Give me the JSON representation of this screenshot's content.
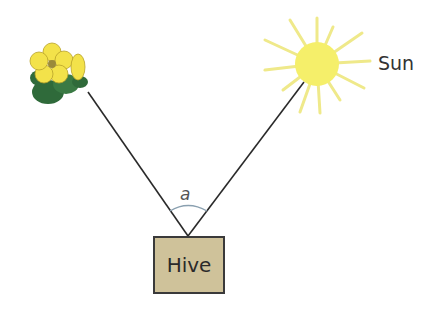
{
  "diagram": {
    "labels": {
      "sun": "Sun",
      "hive": "Hive",
      "angle": "a"
    },
    "nodes": [
      {
        "id": "flower",
        "icon": "flower-icon"
      },
      {
        "id": "sun",
        "icon": "sun-icon",
        "label": "Sun"
      },
      {
        "id": "hive",
        "label": "Hive"
      }
    ],
    "edges": [
      {
        "from": "hive",
        "to": "flower"
      },
      {
        "from": "hive",
        "to": "sun"
      }
    ],
    "colors": {
      "hive_fill": "#cfc29a",
      "sun": "#f5ef6a",
      "rays": "#efe98a",
      "flower": "#f3e24a",
      "leaves": "#2f6a3a",
      "line": "#2a2a2a"
    }
  }
}
